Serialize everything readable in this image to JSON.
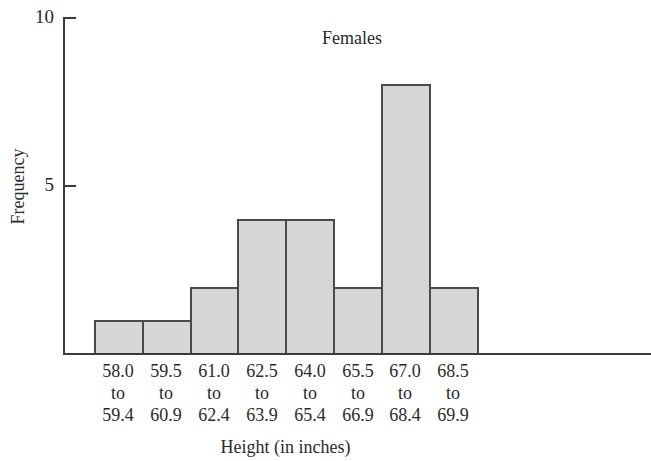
{
  "chart_data": {
    "type": "bar",
    "subtype": "histogram",
    "title": "Females",
    "xlabel": "Height (in inches)",
    "ylabel": "Frequency",
    "ylim": [
      0,
      10
    ],
    "yticks": [
      "5",
      "10"
    ],
    "grid": false,
    "legend": null,
    "categories": [
      {
        "low": "58.0",
        "to": "to",
        "high": "59.4"
      },
      {
        "low": "59.5",
        "to": "to",
        "high": "60.9"
      },
      {
        "low": "61.0",
        "to": "to",
        "high": "62.4"
      },
      {
        "low": "62.5",
        "to": "to",
        "high": "63.9"
      },
      {
        "low": "64.0",
        "to": "to",
        "high": "65.4"
      },
      {
        "low": "65.5",
        "to": "to",
        "high": "66.9"
      },
      {
        "low": "67.0",
        "to": "to",
        "high": "68.4"
      },
      {
        "low": "68.5",
        "to": "to",
        "high": "69.9"
      }
    ],
    "category_labels": [
      "58.0 to 59.4",
      "59.5 to 60.9",
      "61.0 to 62.4",
      "62.5 to 63.9",
      "64.0 to 65.4",
      "65.5 to 66.9",
      "67.0 to 68.4",
      "68.5 to 69.9"
    ],
    "values": [
      1,
      1,
      2,
      4,
      4,
      2,
      8,
      2
    ],
    "colors": {
      "bar_fill": "#d6d6d6",
      "bar_edge": "#4a4a4a",
      "axis": "#3a3a3a"
    }
  }
}
